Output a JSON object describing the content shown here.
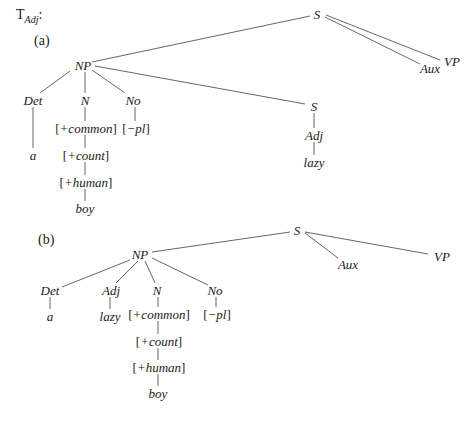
{
  "title": {
    "main": "T",
    "subscript": "Adj",
    "suffix": ":"
  },
  "parts": [
    {
      "label": "(a)",
      "nodes": {
        "S": "S",
        "Aux": "Aux",
        "VP": "VP",
        "NP": "NP",
        "Det": "Det",
        "N": "N",
        "No": "No",
        "common": "+common",
        "pl": "−pl",
        "a": "a",
        "count": "+count",
        "human": "+human",
        "boy": "boy",
        "S2": "S",
        "Adj": "Adj",
        "lazy": "lazy"
      }
    },
    {
      "label": "(b)",
      "nodes": {
        "S": "S",
        "Aux": "Aux",
        "VP": "VP",
        "NP": "NP",
        "Det": "Det",
        "Adj": "Adj",
        "N": "N",
        "No": "No",
        "a": "a",
        "lazy": "lazy",
        "common": "+common",
        "pl": "−pl",
        "count": "+count",
        "human": "+human",
        "boy": "boy"
      }
    }
  ],
  "colors": {
    "line": "#555555",
    "text": "#1a1a1a",
    "background": "#ffffff"
  }
}
